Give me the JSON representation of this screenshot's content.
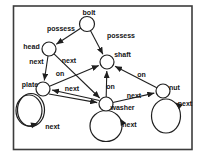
{
  "diagram": {
    "canvas": {
      "w": 206,
      "h": 160,
      "bg": "#ffffff"
    },
    "style": {
      "stroke": "#1f1f1f",
      "frame_stroke": "#3c3c3c",
      "text_color": "#151515",
      "node_fill": "#ffffff",
      "font_size": 7
    },
    "frame": {
      "x": 13.5,
      "y": 6,
      "w": 178.5,
      "h": 143.5
    },
    "nodes": [
      {
        "id": "bolt",
        "label": "bolt",
        "cx": 87,
        "cy": 24,
        "r": 7.5,
        "lx": 89,
        "ly": 14.5
      },
      {
        "id": "head",
        "label": "head",
        "cx": 49,
        "cy": 49,
        "r": 7,
        "lx": 31.5,
        "ly": 48.5
      },
      {
        "id": "shaft",
        "label": "shaft",
        "cx": 107,
        "cy": 62,
        "r": 7,
        "lx": 122.5,
        "ly": 57
      },
      {
        "id": "plate",
        "label": "plate",
        "cx": 43,
        "cy": 89,
        "r": 7,
        "lx": 30,
        "ly": 87
      },
      {
        "id": "washer",
        "label": "washer",
        "cx": 106,
        "cy": 104,
        "r": 7,
        "lx": 122.5,
        "ly": 109.5
      },
      {
        "id": "nut",
        "label": "nut",
        "cx": 163,
        "cy": 91,
        "r": 7,
        "lx": 174.5,
        "ly": 90
      }
    ],
    "edges": [
      {
        "from": "bolt",
        "to": "head",
        "label": "possess",
        "x1": 81.4,
        "y1": 27.7,
        "x2": 56.3,
        "y2": 44.2,
        "lx": 61,
        "ly": 30.5
      },
      {
        "from": "bolt",
        "to": "shaft",
        "label": "possess",
        "x1": 90.3,
        "y1": 30.3,
        "x2": 102.9,
        "y2": 54.2,
        "lx": 121,
        "ly": 37.5
      },
      {
        "from": "head",
        "to": "plate",
        "label": "next",
        "x1": 48,
        "y1": 56,
        "x2": 44.3,
        "y2": 80.5,
        "lx": 36.5,
        "ly": 64
      },
      {
        "from": "head",
        "to": "washer",
        "label": "next",
        "x1": 54,
        "y1": 53.8,
        "x2": 99.7,
        "y2": 98,
        "lx": 69,
        "ly": 62.5
      },
      {
        "from": "plate",
        "to": "shaft",
        "label": "on",
        "x1": 49.5,
        "y1": 86.2,
        "x2": 98.8,
        "y2": 65.4,
        "lx": 60,
        "ly": 76
      },
      {
        "from": "washer",
        "to": "shaft",
        "label": "on",
        "x1": 106.2,
        "y1": 97,
        "x2": 106.8,
        "y2": 71,
        "lx": 110.5,
        "ly": 89
      },
      {
        "from": "nut",
        "to": "shaft",
        "label": "on",
        "x1": 156.8,
        "y1": 87.8,
        "x2": 115,
        "y2": 66.2,
        "lx": 141.5,
        "ly": 76.5
      },
      {
        "from": "washer",
        "to": "plate",
        "label": "next",
        "x1": 99.5,
        "y1": 100.5,
        "x2": 52,
        "y2": 90,
        "lx": 72,
        "ly": 91
      },
      {
        "from": "plate",
        "to": "washer",
        "label": "",
        "x1": 49,
        "y1": 94,
        "x2": 97.2,
        "y2": 102.6,
        "lx": 0,
        "ly": 0
      },
      {
        "from": "washer",
        "to": "nut",
        "label": "next",
        "x1": 112.8,
        "y1": 102.5,
        "x2": 154.3,
        "y2": 93.1,
        "lx": 134,
        "ly": 98
      }
    ],
    "loops": [
      {
        "node": "plate",
        "label": "next",
        "ellipses": [
          {
            "cx": 29,
            "cy": 110.5,
            "rx": 13,
            "ry": 15.5
          },
          {
            "cx": 31,
            "cy": 110,
            "rx": 13.5,
            "ry": 16.5
          }
        ],
        "arrow": {
          "x": 38,
          "y": 123.5,
          "angle": -15
        },
        "lx": 52.5,
        "ly": 129
      },
      {
        "node": "washer",
        "label": "next",
        "ellipses": [
          {
            "cx": 106,
            "cy": 126,
            "rx": 16,
            "ry": 15.5
          }
        ],
        "arrow": {
          "x": 120,
          "y": 118.5,
          "angle": -120
        },
        "lx": 129.5,
        "ly": 126.5
      },
      {
        "node": "nut",
        "label": "next",
        "ellipses": [
          {
            "cx": 166,
            "cy": 116,
            "rx": 14.5,
            "ry": 17
          }
        ],
        "arrow": {
          "x": 175.5,
          "y": 102.5,
          "angle": -140
        },
        "lx": 185,
        "ly": 105.5
      }
    ]
  }
}
